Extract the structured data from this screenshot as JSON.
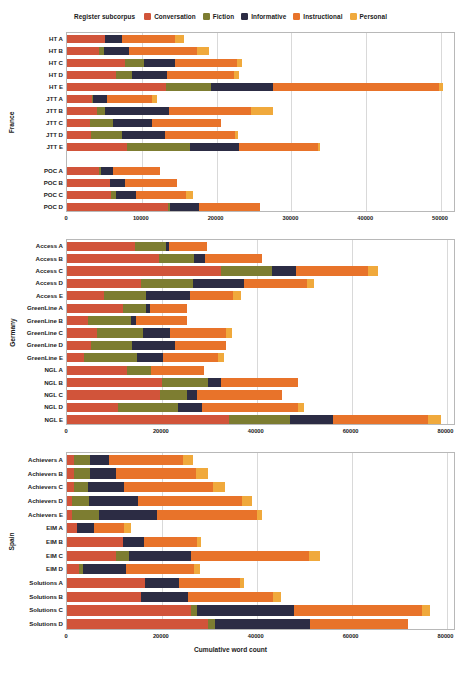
{
  "figure": {
    "xlabel": "Cumulative word count",
    "legend_title": "Register subcorpus",
    "caption": ""
  },
  "colors": {
    "Conversation": "#d1543a",
    "Fiction": "#7d7d31",
    "Informative": "#2c2c44",
    "Instructional": "#e8732a",
    "Personal": "#f0a93c",
    "grid": "#d9d9d9",
    "axis": "#b8b8b8",
    "background": "#ffffff"
  },
  "legend": [
    {
      "label": "Conversation",
      "color": "#d1543a"
    },
    {
      "label": "Fiction",
      "color": "#7d7d31"
    },
    {
      "label": "Informative",
      "color": "#2c2c44"
    },
    {
      "label": "Instructional",
      "color": "#e8732a"
    },
    {
      "label": "Personal",
      "color": "#f0a93c"
    }
  ],
  "chart_data": {
    "type": "bar",
    "orientation": "horizontal",
    "stacked": true,
    "title": "",
    "xlabel": "Cumulative word count",
    "ylabel": "",
    "legend_title": "Register subcorpus",
    "legend_position": "top-center",
    "grid": true,
    "series": [
      "Conversation",
      "Fiction",
      "Informative",
      "Instructional",
      "Personal"
    ],
    "panels": [
      {
        "name": "France",
        "xlim": [
          0,
          52000
        ],
        "xticks": [
          0,
          10000,
          20000,
          30000,
          40000,
          50000
        ],
        "xticklabels": [
          "0",
          "10000",
          "20000",
          "30000",
          "40000",
          "50000"
        ],
        "categories": [
          "HT A",
          "HT B",
          "HT C",
          "HT D",
          "HT E",
          "JTT A",
          "JTT B",
          "JTT C",
          "JTT D",
          "JTT E",
          "POC A",
          "POC B",
          "POC C",
          "POC D"
        ],
        "values": [
          {
            "category": "HT A",
            "Conversation": 5100,
            "Fiction": 0,
            "Informative": 2200,
            "Instructional": 7100,
            "Personal": 1200,
            "total": 15600
          },
          {
            "category": "HT B",
            "Conversation": 4300,
            "Fiction": 700,
            "Informative": 3300,
            "Instructional": 9100,
            "Personal": 1600,
            "total": 19000
          },
          {
            "category": "HT C",
            "Conversation": 7800,
            "Fiction": 2500,
            "Informative": 4100,
            "Instructional": 8300,
            "Personal": 700,
            "total": 23400
          },
          {
            "category": "HT D",
            "Conversation": 6600,
            "Fiction": 2100,
            "Informative": 4700,
            "Instructional": 8900,
            "Personal": 700,
            "total": 23000
          },
          {
            "category": "HT E",
            "Conversation": 13300,
            "Fiction": 5900,
            "Informative": 8300,
            "Instructional": 22200,
            "Personal": 600,
            "total": 50300
          },
          {
            "category": "JTT A",
            "Conversation": 3300,
            "Fiction": 200,
            "Informative": 1900,
            "Instructional": 6000,
            "Personal": 700,
            "total": 12100
          },
          {
            "category": "JTT B",
            "Conversation": 4000,
            "Fiction": 1100,
            "Informative": 8500,
            "Instructional": 11000,
            "Personal": 2900,
            "total": 27500
          },
          {
            "category": "JTT C",
            "Conversation": 3100,
            "Fiction": 3000,
            "Informative": 5300,
            "Instructional": 9200,
            "Personal": 0,
            "total": 20600
          },
          {
            "category": "JTT D",
            "Conversation": 3200,
            "Fiction": 4100,
            "Informative": 5800,
            "Instructional": 9300,
            "Personal": 500,
            "total": 22900
          },
          {
            "category": "JTT E",
            "Conversation": 8000,
            "Fiction": 8400,
            "Informative": 6600,
            "Instructional": 10500,
            "Personal": 300,
            "total": 33800
          },
          {
            "category": "JTT E2",
            "Conversation": 0,
            "Fiction": 0,
            "Informative": 0,
            "Instructional": 0,
            "Personal": 0,
            "total": 0
          },
          {
            "category": "POC A",
            "Conversation": 4300,
            "Fiction": 300,
            "Informative": 1500,
            "Instructional": 6300,
            "Personal": 0,
            "total": 12400
          },
          {
            "category": "POC B",
            "Conversation": 5700,
            "Fiction": 0,
            "Informative": 2000,
            "Instructional": 7000,
            "Personal": 0,
            "total": 14700
          },
          {
            "category": "POC C",
            "Conversation": 5900,
            "Fiction": 700,
            "Informative": 2600,
            "Instructional": 6700,
            "Personal": 1000,
            "total": 16900
          },
          {
            "category": "POC D",
            "Conversation": 13500,
            "Fiction": 300,
            "Informative": 3900,
            "Instructional": 8100,
            "Personal": 0,
            "total": 25800
          }
        ]
      },
      {
        "name": "Germany",
        "xlim": [
          0,
          82000
        ],
        "xticks": [
          0,
          20000,
          40000,
          60000,
          80000
        ],
        "xticklabels": [
          "0",
          "20000",
          "40000",
          "60000",
          "80000"
        ],
        "categories": [
          "Access A",
          "Access B",
          "Access C",
          "Access D",
          "Access E",
          "GreenLine A",
          "GreenLine B",
          "GreenLine C",
          "GreenLine D",
          "GreenLine E",
          "NGL A",
          "NGL B",
          "NGL C",
          "NGL D",
          "NGL E"
        ],
        "values": [
          {
            "category": "Access A",
            "Conversation": 14400,
            "Fiction": 6400,
            "Informative": 600,
            "Instructional": 8200,
            "Personal": 0,
            "total": 29600
          },
          {
            "category": "Access B",
            "Conversation": 19400,
            "Fiction": 7400,
            "Informative": 2200,
            "Instructional": 12100,
            "Personal": 0,
            "total": 41100
          },
          {
            "category": "Access C",
            "Conversation": 32400,
            "Fiction": 10800,
            "Informative": 5000,
            "Instructional": 15200,
            "Personal": 2200,
            "total": 65600
          },
          {
            "category": "Access D",
            "Conversation": 15700,
            "Fiction": 10900,
            "Informative": 10700,
            "Instructional": 13400,
            "Personal": 1400,
            "total": 52100
          },
          {
            "category": "Access E",
            "Conversation": 7800,
            "Fiction": 8900,
            "Informative": 9200,
            "Instructional": 9100,
            "Personal": 1700,
            "total": 36700
          },
          {
            "category": "GreenLine A",
            "Conversation": 11900,
            "Fiction": 4800,
            "Informative": 700,
            "Instructional": 8000,
            "Personal": 0,
            "total": 25400
          },
          {
            "category": "GreenLine B",
            "Conversation": 4500,
            "Fiction": 9000,
            "Informative": 1100,
            "Instructional": 10700,
            "Personal": 0,
            "total": 25300
          },
          {
            "category": "GreenLine C",
            "Conversation": 6300,
            "Fiction": 9700,
            "Informative": 5800,
            "Instructional": 11700,
            "Personal": 1300,
            "total": 34800
          },
          {
            "category": "GreenLine D",
            "Conversation": 5100,
            "Fiction": 8700,
            "Informative": 9000,
            "Instructional": 10700,
            "Personal": 0,
            "total": 33500
          },
          {
            "category": "GreenLine E",
            "Conversation": 3600,
            "Fiction": 11200,
            "Informative": 5400,
            "Instructional": 11700,
            "Personal": 1100,
            "total": 33000
          },
          {
            "category": "NGL A",
            "Conversation": 12600,
            "Fiction": 5200,
            "Informative": 0,
            "Instructional": 11100,
            "Personal": 0,
            "total": 28900
          },
          {
            "category": "NGL B",
            "Conversation": 20100,
            "Fiction": 9700,
            "Informative": 2600,
            "Instructional": 16200,
            "Personal": 0,
            "total": 48600
          },
          {
            "category": "NGL C",
            "Conversation": 19500,
            "Fiction": 5700,
            "Informative": 2200,
            "Instructional": 18000,
            "Personal": 0,
            "total": 45400
          },
          {
            "category": "NGL D",
            "Conversation": 10700,
            "Fiction": 12600,
            "Informative": 5200,
            "Instructional": 20200,
            "Personal": 1200,
            "total": 49900
          },
          {
            "category": "NGL E",
            "Conversation": 34200,
            "Fiction": 12900,
            "Informative": 8900,
            "Instructional": 20000,
            "Personal": 2800,
            "total": 78800
          }
        ]
      },
      {
        "name": "Spain",
        "xlim": [
          0,
          82000
        ],
        "xticks": [
          0,
          20000,
          40000,
          60000,
          80000
        ],
        "xticklabels": [
          "0",
          "20000",
          "40000",
          "60000",
          "80000"
        ],
        "categories": [
          "Achievers A",
          "Achievers B",
          "Achievers C",
          "Achievers D",
          "Achievers E",
          "EIM A",
          "EIM B",
          "EIM C",
          "EIM D",
          "Solutions A",
          "Solutions B",
          "Solutions C",
          "Solutions D"
        ],
        "values": [
          {
            "category": "Achievers A",
            "Conversation": 1500,
            "Fiction": 3300,
            "Informative": 4100,
            "Instructional": 15500,
            "Personal": 2100,
            "total": 26500
          },
          {
            "category": "Achievers B",
            "Conversation": 1400,
            "Fiction": 3500,
            "Informative": 5400,
            "Instructional": 17000,
            "Personal": 2400,
            "total": 29700
          },
          {
            "category": "Achievers C",
            "Conversation": 1400,
            "Fiction": 3100,
            "Informative": 7500,
            "Instructional": 18700,
            "Personal": 2600,
            "total": 33300
          },
          {
            "category": "Achievers D",
            "Conversation": 1000,
            "Fiction": 3700,
            "Informative": 10200,
            "Instructional": 22100,
            "Personal": 2100,
            "total": 39100
          },
          {
            "category": "Achievers E",
            "Conversation": 1000,
            "Fiction": 5800,
            "Informative": 12100,
            "Instructional": 21200,
            "Personal": 1000,
            "total": 41100
          },
          {
            "category": "EIM A",
            "Conversation": 2200,
            "Fiction": 0,
            "Informative": 3400,
            "Instructional": 6500,
            "Personal": 1300,
            "total": 13400
          },
          {
            "category": "EIM B",
            "Conversation": 11900,
            "Fiction": 0,
            "Informative": 4400,
            "Instructional": 11200,
            "Personal": 800,
            "total": 28300
          },
          {
            "category": "EIM C",
            "Conversation": 10400,
            "Fiction": 2700,
            "Informative": 13000,
            "Instructional": 25000,
            "Personal": 2200,
            "total": 53300
          },
          {
            "category": "EIM D",
            "Conversation": 2500,
            "Fiction": 800,
            "Informative": 9200,
            "Instructional": 14300,
            "Personal": 1200,
            "total": 28000
          },
          {
            "category": "Solutions A",
            "Conversation": 16500,
            "Fiction": 0,
            "Informative": 7100,
            "Instructional": 12800,
            "Personal": 1000,
            "total": 37400
          },
          {
            "category": "Solutions B",
            "Conversation": 15700,
            "Fiction": 0,
            "Informative": 9800,
            "Instructional": 18000,
            "Personal": 1600,
            "total": 45100
          },
          {
            "category": "Solutions C",
            "Conversation": 26100,
            "Fiction": 1200,
            "Informative": 20500,
            "Instructional": 27000,
            "Personal": 1800,
            "total": 76600
          },
          {
            "category": "Solutions D",
            "Conversation": 29800,
            "Fiction": 1500,
            "Informative": 20000,
            "Instructional": 20500,
            "Personal": 0,
            "total": 71800
          }
        ]
      }
    ]
  }
}
